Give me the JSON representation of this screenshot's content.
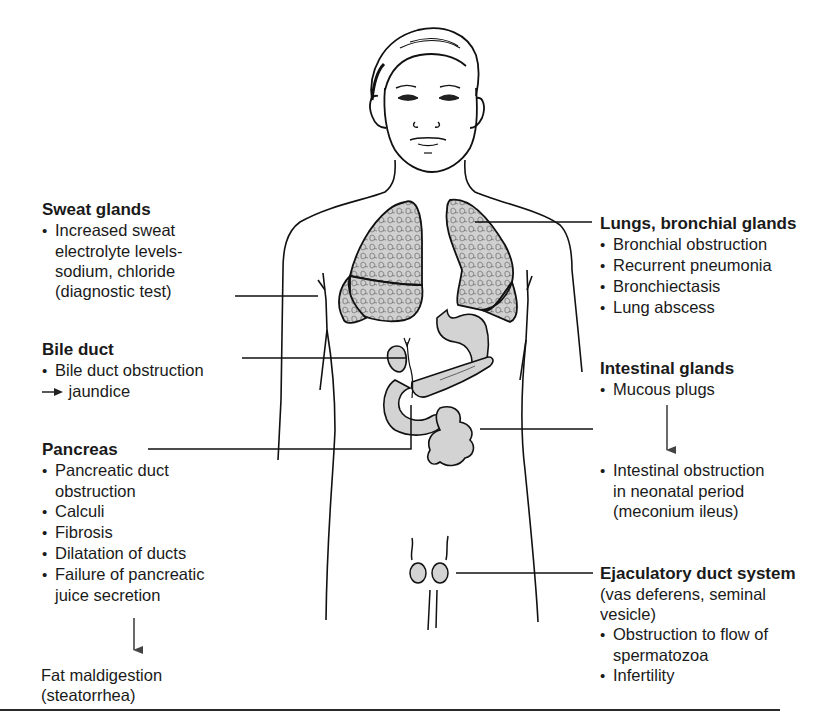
{
  "figure": {
    "colors": {
      "stroke": "#111111",
      "organ_fill": "#d3d3d3",
      "text": "#1a1a1a",
      "background": "#ffffff"
    }
  },
  "labels": {
    "sweat_glands": {
      "title": "Sweat glands",
      "bullets": [
        {
          "lines": [
            "Increased sweat",
            "electrolyte levels-",
            "sodium, chloride",
            "(diagnostic test)"
          ]
        }
      ]
    },
    "bile_duct": {
      "title": "Bile duct",
      "bullets": [
        {
          "lines": [
            "Bile duct obstruction"
          ]
        }
      ],
      "result": "jaundice"
    },
    "pancreas": {
      "title": "Pancreas",
      "bullets": [
        {
          "lines": [
            "Pancreatic duct",
            "obstruction"
          ]
        },
        {
          "lines": [
            "Calculi"
          ]
        },
        {
          "lines": [
            "Fibrosis"
          ]
        },
        {
          "lines": [
            "Dilatation of ducts"
          ]
        },
        {
          "lines": [
            "Failure of pancreatic",
            "juice secretion"
          ]
        }
      ],
      "result": [
        "Fat maldigestion",
        "(steatorrhea)"
      ]
    },
    "lungs": {
      "title": "Lungs, bronchial glands",
      "bullets": [
        {
          "lines": [
            "Bronchial obstruction"
          ]
        },
        {
          "lines": [
            "Recurrent pneumonia"
          ]
        },
        {
          "lines": [
            "Bronchiectasis"
          ]
        },
        {
          "lines": [
            "Lung abscess"
          ]
        }
      ]
    },
    "intestinal": {
      "title": "Intestinal glands",
      "bullets": [
        {
          "lines": [
            "Mucous plugs"
          ]
        }
      ],
      "result": {
        "lines": [
          "Intestinal obstruction",
          "in neonatal period",
          "(meconium ileus)"
        ]
      }
    },
    "ejaculatory": {
      "title": "Ejaculatory duct system",
      "subtitle": [
        "(vas deferens, seminal",
        "vesicle)"
      ],
      "bullets": [
        {
          "lines": [
            "Obstruction to flow of",
            "spermatozoa"
          ]
        },
        {
          "lines": [
            "Infertility"
          ]
        }
      ]
    }
  }
}
